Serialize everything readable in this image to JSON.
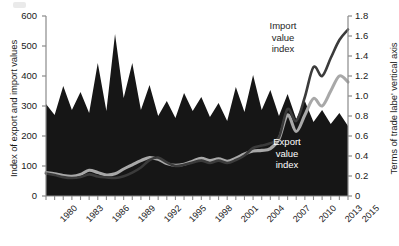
{
  "chart_data": {
    "type": "area",
    "title": "",
    "xlabel": "",
    "ylabel": "Index of export and import values",
    "y2label": "Terms of trade labe' vertical axis",
    "grid": false,
    "legend_position": "inline-annotations",
    "xlim": [
      1980,
      2015
    ],
    "ylim": [
      0,
      600
    ],
    "y2lim": [
      0,
      1.8
    ],
    "ytick_labels": [
      "600",
      "500",
      "400",
      "300",
      "200",
      "100",
      "0"
    ],
    "ytick_values": [
      600,
      500,
      400,
      300,
      200,
      100,
      0
    ],
    "y2tick_labels": [
      "1.8",
      "1.6",
      "1.4",
      "1.2",
      "1.0",
      "0.8",
      "0.6",
      "0.4",
      "0.2",
      "0"
    ],
    "y2tick_values": [
      1.8,
      1.6,
      1.4,
      1.2,
      1.0,
      0.8,
      0.6,
      0.4,
      0.2,
      0
    ],
    "xtick_labels": [
      "1980",
      "1983",
      "1986",
      "1989",
      "1992",
      "1995",
      "1998",
      "2001",
      "2004",
      "2007",
      "2010",
      "2013",
      "2015"
    ],
    "xtick_values": [
      1980,
      1983,
      1986,
      1989,
      1992,
      1995,
      1998,
      2001,
      2004,
      2007,
      2010,
      2013,
      2015
    ],
    "x": [
      1980,
      1981,
      1982,
      1983,
      1984,
      1985,
      1986,
      1987,
      1988,
      1989,
      1990,
      1991,
      1992,
      1993,
      1994,
      1995,
      1996,
      1997,
      1998,
      1999,
      2000,
      2001,
      2002,
      2003,
      2004,
      2005,
      2006,
      2007,
      2008,
      2009,
      2010,
      2011,
      2012,
      2013,
      2014,
      2015
    ],
    "annotations": [
      {
        "name": "terms-of-trade-label",
        "text": "Terms of\ntrade",
        "color": "#ffffff"
      },
      {
        "name": "import-value-index-label",
        "text": "Import\nvalue\nindex",
        "color": "#262626"
      },
      {
        "name": "export-value-index-label",
        "text": "Export\nvalue\nindex",
        "color": "#ffffff"
      }
    ],
    "series": [
      {
        "name": "Terms of trade",
        "type": "area",
        "axis": "right",
        "color": "#161616",
        "label_line1": "Terms of",
        "label_line2": "trade",
        "values": [
          0.92,
          0.81,
          1.1,
          0.86,
          1.04,
          0.83,
          1.33,
          0.85,
          1.62,
          0.98,
          1.33,
          0.86,
          1.11,
          0.8,
          0.95,
          0.78,
          1.03,
          0.85,
          0.99,
          0.79,
          0.93,
          0.75,
          1.09,
          0.84,
          1.21,
          0.86,
          1.06,
          0.8,
          1.02,
          0.77,
          0.95,
          0.74,
          0.86,
          0.72,
          0.83,
          0.7
        ]
      },
      {
        "name": "Import value index",
        "type": "line",
        "axis": "left",
        "color": "#3b3b3b",
        "label_line1": "Import",
        "label_line2": "value",
        "label_line3": "index",
        "values": [
          75,
          70,
          63,
          60,
          63,
          72,
          65,
          62,
          60,
          66,
          78,
          95,
          120,
          128,
          112,
          100,
          104,
          112,
          118,
          110,
          118,
          110,
          120,
          135,
          160,
          168,
          176,
          196,
          290,
          250,
          330,
          430,
          400,
          460,
          520,
          555
        ]
      },
      {
        "name": "Export value index",
        "type": "line",
        "axis": "left",
        "color": "#a8a8a8",
        "label_line1": "Export",
        "label_line2": "value",
        "label_line3": "index",
        "values": [
          78,
          74,
          68,
          66,
          72,
          86,
          78,
          70,
          74,
          90,
          104,
          118,
          128,
          122,
          108,
          102,
          106,
          116,
          126,
          118,
          124,
          116,
          126,
          140,
          150,
          152,
          158,
          190,
          270,
          215,
          270,
          325,
          300,
          350,
          400,
          380
        ]
      }
    ]
  }
}
